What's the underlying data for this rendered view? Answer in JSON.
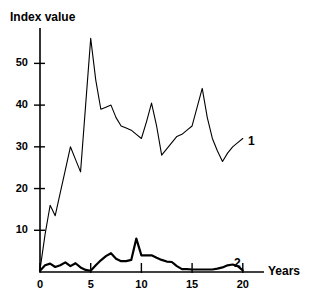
{
  "chart_data": {
    "type": "line",
    "title": "",
    "ylabel": "Index value",
    "xlabel": "Years",
    "xlim": [
      0,
      21.5
    ],
    "ylim": [
      0,
      58
    ],
    "grid": false,
    "legend": "inline-end-labels",
    "xticks": [
      "0",
      "5",
      "10",
      "15",
      "20"
    ],
    "xtick_values": [
      0,
      5,
      10,
      15,
      20
    ],
    "yticks": [
      "10",
      "20",
      "30",
      "40",
      "50"
    ],
    "ytick_values": [
      10,
      20,
      30,
      40,
      50
    ],
    "series": [
      {
        "name": "1",
        "label": "1",
        "stroke": "#000000",
        "width": 1.1,
        "x": [
          0,
          0.5,
          1,
          1.5,
          2,
          2.5,
          3,
          3.5,
          4,
          4.5,
          5,
          5.5,
          6,
          6.5,
          7,
          7.5,
          8,
          8.5,
          9,
          9.5,
          10,
          10.5,
          11,
          11.5,
          12,
          12.5,
          13,
          13.5,
          14,
          14.5,
          15,
          15.5,
          16,
          16.5,
          17,
          17.5,
          18,
          18.5,
          19,
          19.5,
          20
        ],
        "values": [
          0.5,
          9,
          16,
          13.5,
          19,
          24.5,
          30,
          27,
          24,
          40,
          56,
          46,
          39,
          39.5,
          40,
          37,
          35,
          34.5,
          34,
          33,
          32,
          36,
          40.5,
          35,
          28,
          29.5,
          31,
          32.5,
          33,
          34,
          35,
          39.5,
          44,
          37,
          32,
          29,
          26.5,
          28.5,
          30,
          31,
          32
        ]
      },
      {
        "name": "2",
        "label": "2",
        "stroke": "#000000",
        "width": 2.2,
        "x": [
          0,
          0.5,
          1,
          1.5,
          2,
          2.5,
          3,
          3.5,
          4,
          4.5,
          5,
          5.5,
          6,
          6.5,
          7,
          7.5,
          8,
          8.5,
          9,
          9.5,
          10,
          10.5,
          11,
          11.5,
          12,
          12.5,
          13,
          13.5,
          14,
          14.5,
          15,
          15.5,
          16,
          16.5,
          17,
          17.5,
          18,
          18.5,
          19,
          19.5,
          20
        ],
        "values": [
          0.3,
          1.6,
          2,
          1.2,
          1.6,
          2.3,
          1.4,
          2.1,
          1.1,
          0.5,
          0.3,
          1.6,
          2.8,
          3.8,
          4.5,
          3.2,
          2.6,
          2.6,
          2.9,
          8,
          4,
          4,
          4,
          3.4,
          2.9,
          2.5,
          2.4,
          1.4,
          0.7,
          0.7,
          0.6,
          0.6,
          0.6,
          0.6,
          0.6,
          0.8,
          1.1,
          1.6,
          1.8,
          1.4,
          0.4
        ]
      }
    ],
    "series_label_positions": [
      {
        "label": "1",
        "x_px": 248,
        "y_px": 134
      },
      {
        "label": "2",
        "x_px": 234,
        "y_px": 256
      }
    ]
  }
}
